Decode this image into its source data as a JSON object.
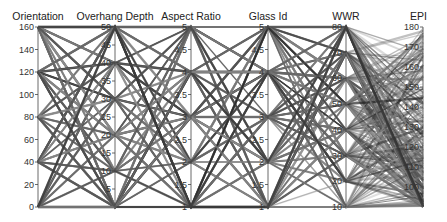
{
  "chart_data": {
    "type": "parallel_coordinates",
    "title": "",
    "background": "#ffffff",
    "line_color": "#2a2a2a",
    "layout": {
      "top": 27,
      "bottom": 207
    },
    "axes": [
      {
        "name": "Orientation",
        "x": 38,
        "min": 0,
        "max": 160,
        "ticks": [
          0,
          20,
          40,
          60,
          80,
          100,
          120,
          140,
          160
        ],
        "levels": [
          0,
          40,
          80,
          120,
          160
        ],
        "label_anchor": "middle"
      },
      {
        "name": "Overhang Depth",
        "x": 115,
        "min": 0,
        "max": 50,
        "ticks": [
          5,
          10,
          15,
          20,
          25,
          30,
          35,
          40,
          45,
          50
        ],
        "levels": [
          0,
          10,
          20,
          30,
          40,
          50
        ],
        "label_anchor": "middle"
      },
      {
        "name": "Aspect Ratio",
        "x": 191,
        "min": 1,
        "max": 5,
        "ticks": [
          1,
          1.5,
          2,
          2.5,
          3,
          3.5,
          4,
          4.5,
          5
        ],
        "levels": [
          1,
          2,
          3,
          4,
          5
        ],
        "label_anchor": "middle"
      },
      {
        "name": "Glass Id",
        "x": 268,
        "min": 1,
        "max": 5,
        "ticks": [
          1,
          1.5,
          2,
          2.5,
          3,
          3.5,
          4,
          4.5,
          5
        ],
        "levels": [
          1,
          2,
          3,
          4,
          5
        ],
        "label_anchor": "middle"
      },
      {
        "name": "WWR",
        "x": 346,
        "min": 10,
        "max": 80,
        "ticks": [
          10,
          20,
          30,
          40,
          50,
          60,
          70,
          80
        ],
        "levels": [
          10,
          20,
          30,
          40,
          50,
          60,
          70,
          80
        ],
        "label_anchor": "middle"
      },
      {
        "name": "EPI",
        "x": 423,
        "min": 90,
        "max": 180,
        "ticks": [
          100,
          110,
          120,
          130,
          140,
          150,
          160,
          170,
          180
        ],
        "levels": null,
        "label_anchor": "end"
      }
    ],
    "legend": null,
    "grid": false
  }
}
